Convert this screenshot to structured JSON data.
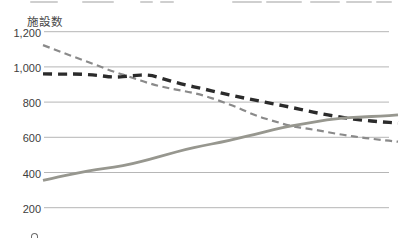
{
  "axis": {
    "unit_label": "施設数"
  },
  "chart_data": {
    "type": "line",
    "title": "",
    "xlabel": "",
    "ylabel": "施設数",
    "grid": true,
    "legend_position": "none-visible",
    "x_axis_labels_visible": false,
    "ylim": [
      200,
      1200
    ],
    "yticks": [
      {
        "value": 1200,
        "label": "1,200"
      },
      {
        "value": 1000,
        "label": "1,000"
      },
      {
        "value": 800,
        "label": "800"
      },
      {
        "value": 600,
        "label": "600"
      },
      {
        "value": 400,
        "label": "400"
      },
      {
        "value": 200,
        "label": "200"
      }
    ],
    "series": [
      {
        "name": "thin-dashed-gray-line",
        "style": "dashed-thin",
        "color": "#8a8a8a",
        "trend": "decreasing",
        "values": [
          1124,
          1085,
          1048,
          1010,
          972,
          940,
          905,
          880,
          862,
          840,
          805,
          768,
          722,
          692,
          662,
          648,
          630,
          612,
          598,
          586,
          575
        ]
      },
      {
        "name": "thick-dashed-black-line",
        "style": "dashed-thick",
        "color": "#2b2b2b",
        "trend": "decreasing",
        "values": [
          960,
          958,
          960,
          953,
          940,
          950,
          957,
          925,
          898,
          876,
          852,
          830,
          810,
          790,
          770,
          748,
          727,
          710,
          697,
          688,
          681
        ]
      },
      {
        "name": "solid-gray-line",
        "style": "solid",
        "color": "#97978f",
        "trend": "increasing",
        "values": [
          355,
          378,
          398,
          418,
          430,
          448,
          475,
          503,
          530,
          552,
          572,
          594,
          618,
          645,
          665,
          682,
          700,
          710,
          716,
          720,
          727
        ]
      }
    ]
  },
  "layout_px": {
    "plot_x_start": 43,
    "plot_x_end": 398,
    "grid_x_start": 44,
    "grid_x_end": 389,
    "y_of_1200": 31.7,
    "px_per_200": 35.2
  }
}
